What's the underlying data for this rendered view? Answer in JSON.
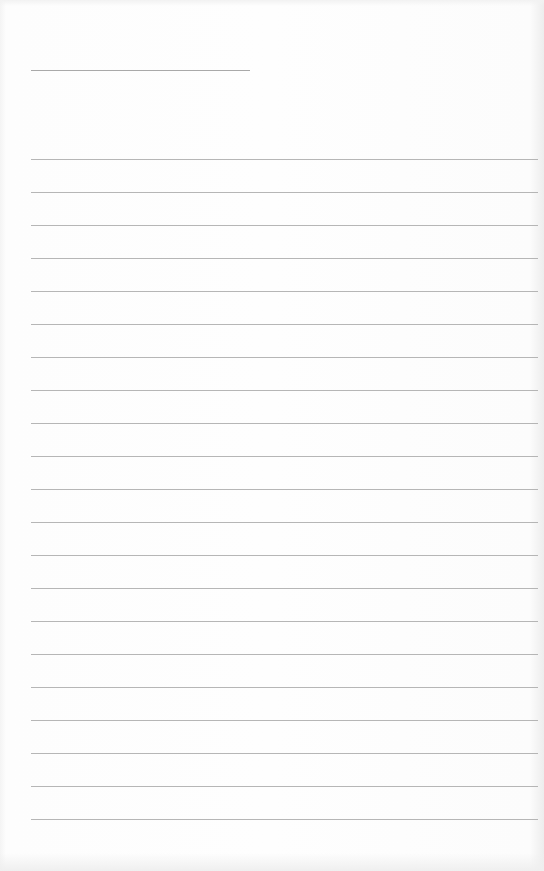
{
  "page": {
    "type": "blank lined paper",
    "background_color": "#fdfdfd",
    "line_color": "#a9a9a9"
  },
  "title_line": {
    "x_start": 31,
    "x_end": 250,
    "y": 70
  },
  "ruled_lines": {
    "x_start": 31,
    "x_end": 538,
    "first_y": 159,
    "spacing": 33,
    "count": 21
  }
}
